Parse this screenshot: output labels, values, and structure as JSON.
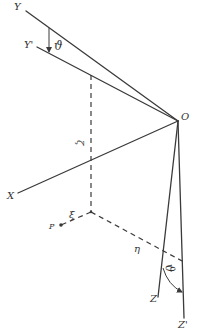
{
  "diagram": {
    "type": "coordinate-rotation",
    "origin": {
      "label": "O",
      "x": 178,
      "y": 121
    },
    "axes": [
      {
        "label": "Y",
        "from": [
          26,
          11
        ],
        "to": [
          178,
          121
        ],
        "label_pos": [
          14,
          10
        ]
      },
      {
        "label": "Y'",
        "from": [
          37,
          47
        ],
        "to": [
          178,
          121
        ],
        "label_pos": [
          25,
          47
        ]
      },
      {
        "label": "X",
        "from": [
          18,
          193
        ],
        "to": [
          178,
          121
        ],
        "label_pos": [
          7,
          198
        ]
      },
      {
        "label": "Z",
        "from": [
          178,
          121
        ],
        "to": [
          158,
          297
        ],
        "label_pos": [
          150,
          301
        ]
      },
      {
        "label": "Z'",
        "from": [
          178,
          121
        ],
        "to": [
          184,
          318
        ],
        "label_pos": [
          179,
          329
        ]
      }
    ],
    "angles": [
      {
        "label": "ϑ",
        "between": [
          "Y",
          "Y'"
        ],
        "label_pos": [
          58,
          50
        ]
      },
      {
        "label": "ϑ",
        "between": [
          "Z",
          "Z'"
        ],
        "label_pos": [
          170,
          276
        ]
      }
    ],
    "point": {
      "label": "P",
      "x": 61,
      "y": 225,
      "label_pos": [
        50,
        228
      ]
    },
    "coordinates": [
      {
        "label": "ξ",
        "desc": "along X direction",
        "label_pos": [
          72,
          218
        ]
      },
      {
        "label": "η",
        "desc": "along Y direction",
        "label_pos": [
          136,
          251
        ]
      },
      {
        "label": "ζ",
        "desc": "along Z direction",
        "label_pos": [
          79,
          146
        ]
      }
    ],
    "colors": {
      "ink": "#3a3a3a",
      "background": "#ffffff"
    }
  }
}
